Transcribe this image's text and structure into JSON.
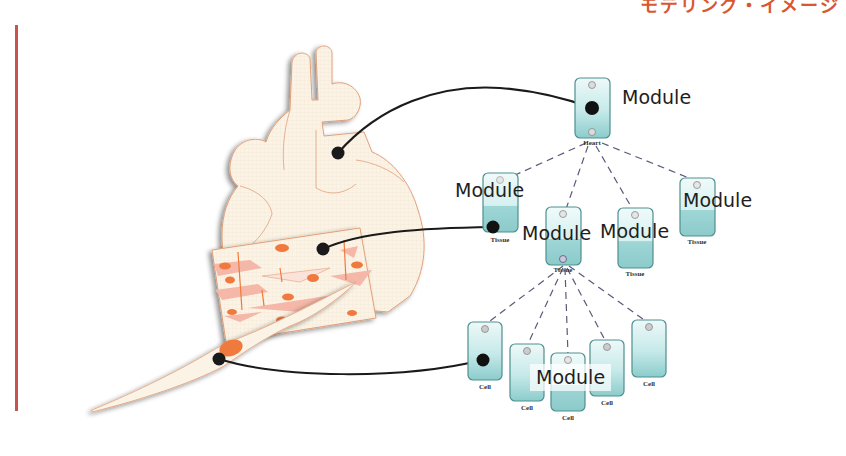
{
  "header": {
    "title_partial": "モデリング・イメージ",
    "color": "#d9572f"
  },
  "diagram": {
    "illustration": {
      "organ": "heart",
      "tissue": "cardiac-muscle-tissue",
      "cell": "cardiomyocyte"
    },
    "nodes": {
      "heart": {
        "caption": "Heart",
        "label": "Module"
      },
      "tissues": [
        {
          "caption": "Tissue",
          "label": "Module"
        },
        {
          "caption": "Tissue",
          "label": "Module"
        },
        {
          "caption": "Tissue",
          "label": "Module"
        },
        {
          "caption": "Tissue",
          "label": "Module"
        }
      ],
      "cells": [
        {
          "caption": "Cell"
        },
        {
          "caption": "Cell"
        },
        {
          "caption": "Cell"
        },
        {
          "caption": "Cell"
        },
        {
          "caption": "Cell"
        }
      ],
      "cell_group_label": "Module"
    },
    "colors": {
      "node_fill_top": "#e6f6f6",
      "node_fill_bottom": "#8fcfcf",
      "node_border": "#4f8f8f",
      "connector": "#1a1a1a",
      "dashed_edge": "#5a5a7a",
      "heart_fill": "#fbf3e6",
      "heart_outline": "#e2a07a",
      "tissue_accent": "#f07a3c",
      "tissue_pink": "#f4b7a8",
      "accent_rule": "#c9534f"
    }
  }
}
